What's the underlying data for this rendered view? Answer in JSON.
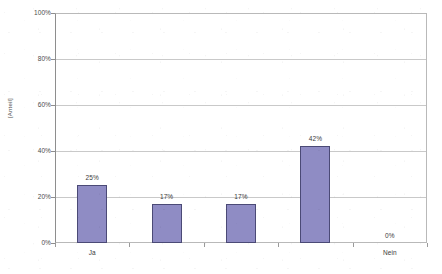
{
  "chart_data": {
    "type": "bar",
    "title": "",
    "subtitle": "",
    "xlabel": "",
    "ylabel": "[Anteil]",
    "categories": [
      "Ja",
      "",
      "",
      "",
      "Nein"
    ],
    "values": [
      25,
      17,
      17,
      42,
      0
    ],
    "value_labels": [
      "25%",
      "17%",
      "17%",
      "42%",
      "0%"
    ],
    "ylim": [
      0,
      100
    ],
    "y_ticks": [
      0,
      20,
      40,
      60,
      80,
      100
    ],
    "y_tick_labels": [
      "0%",
      "20%",
      "40%",
      "60%",
      "80%",
      "100%"
    ],
    "grid": true,
    "legend": "none",
    "series": [
      {
        "name": "Anteil",
        "values": [
          25,
          17,
          17,
          42,
          0
        ],
        "color": "#8F8CC4",
        "border_color": "#4B4A76"
      }
    ]
  },
  "axis": {
    "y_title": "[Anteil]",
    "tick_0": "0%",
    "tick_20": "20%",
    "tick_40": "40%",
    "tick_60": "60%",
    "tick_80": "80%",
    "tick_100": "100%"
  },
  "bars": [
    {
      "label": "25%",
      "category": "Ja",
      "value": 25
    },
    {
      "label": "17%",
      "category": "",
      "value": 17
    },
    {
      "label": "17%",
      "category": "",
      "value": 17
    },
    {
      "label": "42%",
      "category": "",
      "value": 42
    },
    {
      "label": "0%",
      "category": "Nein",
      "value": 0
    }
  ],
  "colors": {
    "bar_fill": "#8F8CC4",
    "bar_border": "#4B4A76",
    "gridline": "#C9C9C9",
    "plot_border": "#B9B9B9",
    "text": "#3A3A3A",
    "background": "#FFFFFF"
  }
}
